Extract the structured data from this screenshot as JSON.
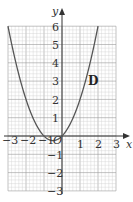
{
  "chart_data": {
    "type": "line",
    "title": "",
    "xlabel": "x",
    "ylabel": "y",
    "xlim": [
      -3,
      3
    ],
    "ylim": [
      -3,
      6
    ],
    "grid": true,
    "grid_minor_divisions": 5,
    "x_ticks": [
      "-3",
      "-2",
      "-1",
      "O",
      "1",
      "2",
      "3"
    ],
    "y_ticks": [
      "6",
      "5",
      "4",
      "3",
      "2",
      "1",
      "-1",
      "-2",
      "-3"
    ],
    "series": [
      {
        "name": "D",
        "equation": "y = x^2 + x",
        "x": [
          -3,
          -2.5,
          -2,
          -1.5,
          -1,
          -0.5,
          0,
          0.5,
          1,
          1.5,
          2
        ],
        "y": [
          6,
          3.75,
          2,
          0.75,
          0,
          -0.25,
          0,
          0.75,
          2,
          3.75,
          6
        ]
      }
    ],
    "annotations": [
      {
        "text": "D",
        "x": 1.7,
        "y": 3
      }
    ]
  },
  "labels": {
    "x_axis": "x",
    "y_axis": "y",
    "origin": "O",
    "curve": "D",
    "x_neg3": "−3",
    "x_neg2": "−2",
    "x_neg1": "−1",
    "x_1": "1",
    "x_2": "2",
    "x_3": "3",
    "y_6": "6",
    "y_5": "5",
    "y_4": "4",
    "y_3": "3",
    "y_2": "2",
    "y_1": "1",
    "y_neg1": "−1",
    "y_neg2": "−2",
    "y_neg3": "−3"
  },
  "colors": {
    "grid_minor": "#cfcfcf",
    "grid_major": "#9a9a9a",
    "axis": "#333333",
    "curve": "#555555"
  }
}
